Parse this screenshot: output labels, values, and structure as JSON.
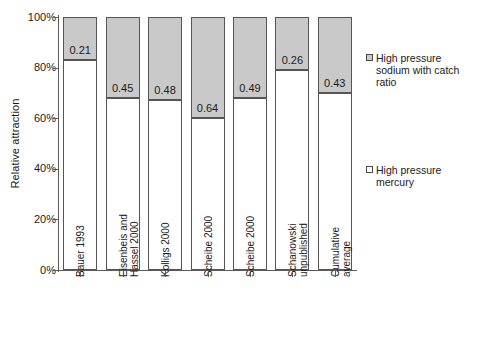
{
  "chart_data": {
    "type": "bar",
    "title": "",
    "subtitle": "",
    "xlabel": "",
    "ylabel": "Relative attraction",
    "ylim": [
      0,
      100
    ],
    "ytick_labels": [
      "100%",
      "80%",
      "60%",
      "40%",
      "20%",
      "0%"
    ],
    "ytick_values": [
      100,
      80,
      60,
      40,
      20,
      0
    ],
    "grid": false,
    "stacked": true,
    "legend_position": "right",
    "categories": [
      "Bauer 1993",
      "Eisenbeis and\nHassel 2000",
      "Kolligs 2000",
      "Scheibe 2000",
      "Scheibe 2000",
      "Schanowski\nunpublished",
      "Cumulative\naverage"
    ],
    "series": [
      {
        "name": "High pressure\nmercury",
        "color": "#ffffff",
        "values": [
          83,
          68,
          67,
          60,
          68,
          79,
          70
        ]
      },
      {
        "name": "High pressure\nsodium with catch\nratio",
        "color": "#c9c9c9",
        "values": [
          17,
          32,
          33,
          40,
          32,
          21,
          30
        ]
      }
    ],
    "data_labels": [
      "0.21",
      "0.45",
      "0.48",
      "0.64",
      "0.49",
      "0.26",
      "0.43"
    ],
    "annotations": []
  },
  "legend": {
    "entries": [
      {
        "label": "High pressure\nsodium with catch\nratio",
        "swatch": "filled",
        "color": "#c9c9c9"
      },
      {
        "label": "High pressure\nmercury",
        "swatch": "empty",
        "color": "#ffffff"
      }
    ]
  },
  "colors": {
    "fill_gray": "#c9c9c9",
    "fill_white": "#ffffff",
    "stroke": "#555555",
    "axis": "#5a5a5a",
    "text": "#1a1a1a",
    "background": "#ffffff"
  }
}
